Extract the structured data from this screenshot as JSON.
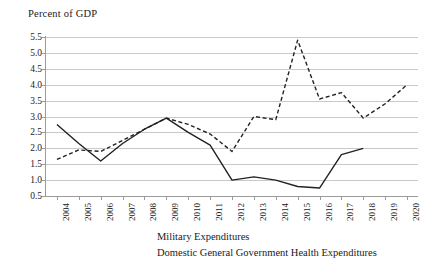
{
  "chart_data": {
    "type": "line",
    "title": "Percent of GDP",
    "xlabel": "",
    "ylabel": "Percent of GDP",
    "x": [
      2004,
      2005,
      2006,
      2007,
      2008,
      2009,
      2010,
      2011,
      2012,
      2013,
      2014,
      2015,
      2016,
      2017,
      2018,
      2019,
      2020
    ],
    "categories": [
      "2004",
      "2005",
      "2006",
      "2007",
      "2008",
      "2009",
      "2010",
      "2011",
      "2012",
      "2013",
      "2014",
      "2015",
      "2016",
      "2017",
      "2018",
      "2019",
      "2020"
    ],
    "ylim": [
      0.5,
      5.5
    ],
    "yticks": [
      0.5,
      1.0,
      1.5,
      2.0,
      2.5,
      3.0,
      3.5,
      4.0,
      4.5,
      5.0,
      5.5
    ],
    "ytick_labels": [
      "0.5",
      "1.0",
      "1.5",
      "2.0",
      "2.5",
      "3.0",
      "3.5",
      "4.0",
      "4.5",
      "5.0",
      "5.5"
    ],
    "grid": true,
    "legend_position": "bottom",
    "series": [
      {
        "name": "Military Expenditures",
        "style": "dashed",
        "color": "#222222",
        "values": [
          1.65,
          1.95,
          1.9,
          2.25,
          2.6,
          2.95,
          2.75,
          2.45,
          1.9,
          3.0,
          2.9,
          5.4,
          3.55,
          3.75,
          2.95,
          3.4,
          4.0
        ]
      },
      {
        "name": "Domestic General Government Health Expenditures",
        "style": "solid",
        "color": "#222222",
        "values": [
          2.75,
          2.15,
          1.6,
          2.15,
          2.6,
          2.95,
          2.5,
          2.1,
          1.0,
          1.1,
          1.0,
          0.8,
          0.75,
          1.8,
          2.0,
          null,
          null
        ]
      }
    ]
  },
  "legend": {
    "items": [
      {
        "label": "Military Expenditures",
        "style": "dashed"
      },
      {
        "label": "Domestic General Government Health Expenditures",
        "style": "solid"
      }
    ]
  }
}
